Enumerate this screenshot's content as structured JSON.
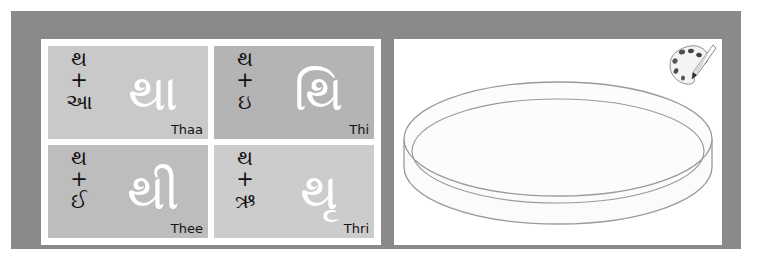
{
  "slide": {
    "frame_color": "#8a8a8a",
    "background_color": "#ffffff"
  },
  "syllable_card": {
    "background_color": "#ffffff",
    "cells": [
      {
        "id": "thaa",
        "consonant": "થ",
        "operator": "+",
        "vowel": "આ",
        "result": "થા",
        "romanization": "Thaa",
        "cell_background": "#c9c9c9",
        "result_color": "#ffffff",
        "text_color": "#111111"
      },
      {
        "id": "thi",
        "consonant": "થ",
        "operator": "+",
        "vowel": "ઇ",
        "result": "થિ",
        "romanization": "Thi",
        "cell_background": "#b4b4b4",
        "result_color": "#ffffff",
        "text_color": "#111111"
      },
      {
        "id": "thee",
        "consonant": "થ",
        "operator": "+",
        "vowel": "ઈ",
        "result": "થી",
        "romanization": "Thee",
        "cell_background": "#bdbdbd",
        "result_color": "#ffffff",
        "text_color": "#111111"
      },
      {
        "id": "thri",
        "consonant": "થ",
        "operator": "+",
        "vowel": "ઋ",
        "result": "થૃ",
        "romanization": "Thri",
        "cell_background": "#cccccc",
        "result_color": "#ffffff",
        "text_color": "#111111"
      }
    ]
  },
  "drawing_canvas": {
    "background_color": "#ffffff",
    "shape_name": "cylinder-disc",
    "stroke_color": "#9a9a9a",
    "fill_color": "#fbfbfb",
    "palette_icon_label": "paint-palette-icon"
  }
}
